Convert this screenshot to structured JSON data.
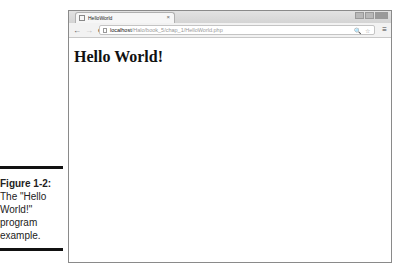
{
  "browser": {
    "tab": {
      "title": "HelloWorld",
      "close_glyph": "×"
    },
    "toolbar": {
      "back_glyph": "←",
      "forward_glyph": "→",
      "reload_glyph": "C",
      "url_host": "localhost",
      "url_path": "/Halo/book_5/chap_1/HelloWorld.php",
      "omni_icons": "🔍 ☆",
      "menu_glyph": "≡"
    },
    "page": {
      "heading": "Hello World!"
    }
  },
  "caption": {
    "label": "Figure 1-2:",
    "text": "The \"Hello World!\" program example."
  }
}
